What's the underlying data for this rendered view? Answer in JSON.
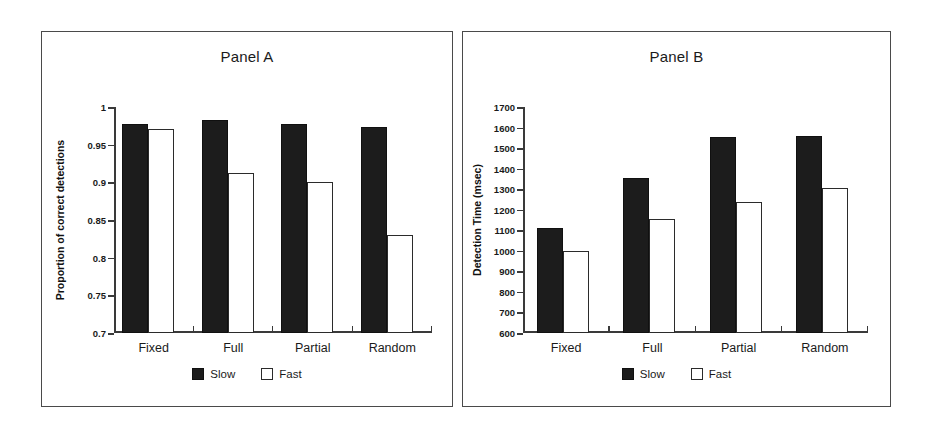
{
  "figure": {
    "panels": [
      {
        "id": "A",
        "title": "Panel A"
      },
      {
        "id": "B",
        "title": "Panel B"
      }
    ]
  },
  "legend": {
    "slow_label": "Slow",
    "fast_label": "Fast",
    "slow_color": "#1c1c1c",
    "fast_color": "#ffffff",
    "border_color": "#2b2b2b"
  },
  "chart_data": [
    {
      "type": "bar",
      "title": "Panel A",
      "xlabel": "",
      "ylabel": "Proportion of correct detections",
      "categories": [
        "Fixed",
        "Full",
        "Partial",
        "Random"
      ],
      "ylim": [
        0.7,
        1.0
      ],
      "yticks": [
        0.7,
        0.75,
        0.8,
        0.85,
        0.9,
        0.95,
        1
      ],
      "ytick_labels": [
        "0.7",
        "0.75",
        "0.8",
        "0.85",
        "0.9",
        "0.95",
        "1"
      ],
      "grid": false,
      "legend_position": "bottom-center",
      "series": [
        {
          "name": "Slow",
          "color": "#1c1c1c",
          "values": [
            0.977,
            0.983,
            0.977,
            0.973
          ]
        },
        {
          "name": "Fast",
          "color": "#ffffff",
          "values": [
            0.971,
            0.913,
            0.901,
            0.83
          ]
        }
      ]
    },
    {
      "type": "bar",
      "title": "Panel B",
      "xlabel": "",
      "ylabel": "Detection Time (msec)",
      "categories": [
        "Fixed",
        "Full",
        "Partial",
        "Random"
      ],
      "ylim": [
        600,
        1700
      ],
      "yticks": [
        600,
        700,
        800,
        900,
        1000,
        1100,
        1200,
        1300,
        1400,
        1500,
        1600,
        1700
      ],
      "ytick_labels": [
        "600",
        "700",
        "800",
        "900",
        "1000",
        "1100",
        "1200",
        "1300",
        "1400",
        "1500",
        "1600",
        "1700"
      ],
      "grid": false,
      "legend_position": "bottom-center",
      "series": [
        {
          "name": "Slow",
          "color": "#1c1c1c",
          "values": [
            1110,
            1355,
            1555,
            1560
          ]
        },
        {
          "name": "Fast",
          "color": "#ffffff",
          "values": [
            1000,
            1155,
            1240,
            1305
          ]
        }
      ]
    }
  ]
}
